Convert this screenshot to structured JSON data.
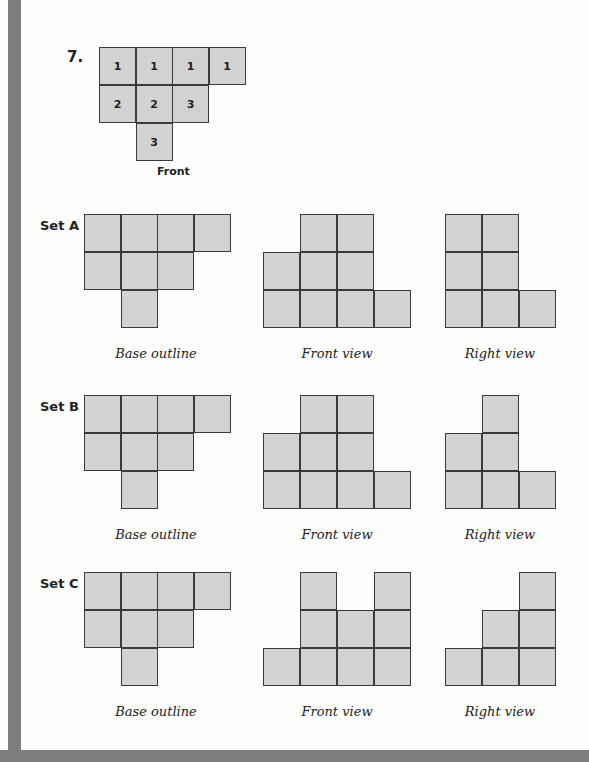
{
  "problem": {
    "number": "7.",
    "base_grid": [
      {
        "row": 0,
        "col": 0,
        "value": "1"
      },
      {
        "row": 0,
        "col": 1,
        "value": "1"
      },
      {
        "row": 0,
        "col": 2,
        "value": "1"
      },
      {
        "row": 0,
        "col": 3,
        "value": "1"
      },
      {
        "row": 1,
        "col": 0,
        "value": "2"
      },
      {
        "row": 1,
        "col": 1,
        "value": "2"
      },
      {
        "row": 1,
        "col": 2,
        "value": "3"
      },
      {
        "row": 2,
        "col": 1,
        "value": "3"
      }
    ],
    "front_label": "Front"
  },
  "sets": [
    {
      "label": "Set A",
      "captions": {
        "base": "Base outline",
        "front": "Front view",
        "right": "Right view"
      },
      "front_heights": [
        2,
        3,
        3,
        1
      ],
      "right_heights": [
        3,
        3,
        1
      ]
    },
    {
      "label": "Set B",
      "captions": {
        "base": "Base outline",
        "front": "Front view",
        "right": "Right view"
      },
      "front_heights": [
        2,
        3,
        3,
        1
      ],
      "right_heights": [
        2,
        3,
        1
      ]
    },
    {
      "label": "Set C",
      "captions": {
        "base": "Base outline",
        "front": "Front view",
        "right": "Right view"
      },
      "front_heights": [
        1,
        3,
        2,
        3
      ],
      "right_heights": [
        1,
        2,
        3
      ]
    }
  ],
  "colors": {
    "cell_fill": "#d2d2d2",
    "border": "#3a3a3a",
    "side_bar": "#7d7d7d"
  }
}
